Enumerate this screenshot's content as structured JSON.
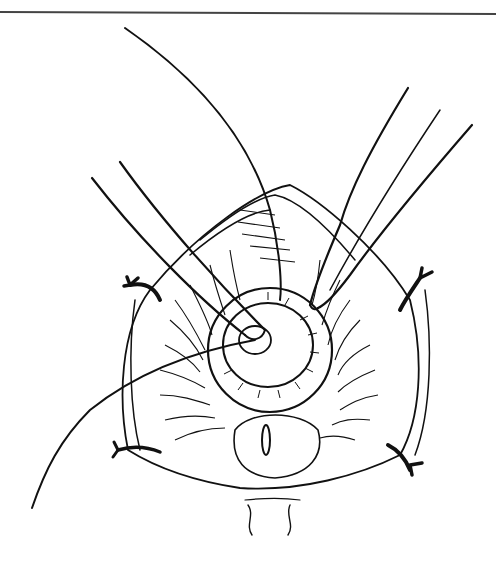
{
  "figure": {
    "description": "Surgical line illustration: dilated circular opening with radiating tissue folds, two forceps instruments inserted, a suture thread, and four stay sutures at the corners",
    "colors": {
      "ink": "#111111",
      "background": "#ffffff"
    },
    "elements": [
      "top-rule",
      "forceps-left",
      "forceps-right",
      "suture-thread",
      "circular-opening",
      "radiating-folds",
      "stay-suture-top-left",
      "stay-suture-top-right",
      "stay-suture-bottom-left",
      "stay-suture-bottom-right",
      "lower-mound-with-slit"
    ]
  }
}
